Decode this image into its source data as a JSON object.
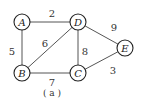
{
  "graph": {
    "nodes": [
      {
        "id": "A",
        "label": "A",
        "x": 22,
        "y": 22
      },
      {
        "id": "D",
        "label": "D",
        "x": 78,
        "y": 22
      },
      {
        "id": "E",
        "label": "E",
        "x": 125,
        "y": 48
      },
      {
        "id": "B",
        "label": "B",
        "x": 22,
        "y": 73
      },
      {
        "id": "C",
        "label": "C",
        "x": 78,
        "y": 73
      }
    ],
    "edges": [
      {
        "from": "A",
        "to": "D",
        "weight": "2",
        "lx": 52,
        "ly": 13
      },
      {
        "from": "A",
        "to": "B",
        "weight": "5",
        "lx": 12,
        "ly": 51
      },
      {
        "from": "B",
        "to": "D",
        "weight": "6",
        "lx": 45,
        "ly": 43
      },
      {
        "from": "D",
        "to": "C",
        "weight": "8",
        "lx": 85,
        "ly": 51
      },
      {
        "from": "D",
        "to": "E",
        "weight": "9",
        "lx": 114,
        "ly": 27
      },
      {
        "from": "C",
        "to": "E",
        "weight": "3",
        "lx": 113,
        "ly": 70
      },
      {
        "from": "B",
        "to": "C",
        "weight": "7",
        "lx": 52,
        "ly": 82
      }
    ],
    "node_radius": 8
  },
  "caption": "( a )"
}
